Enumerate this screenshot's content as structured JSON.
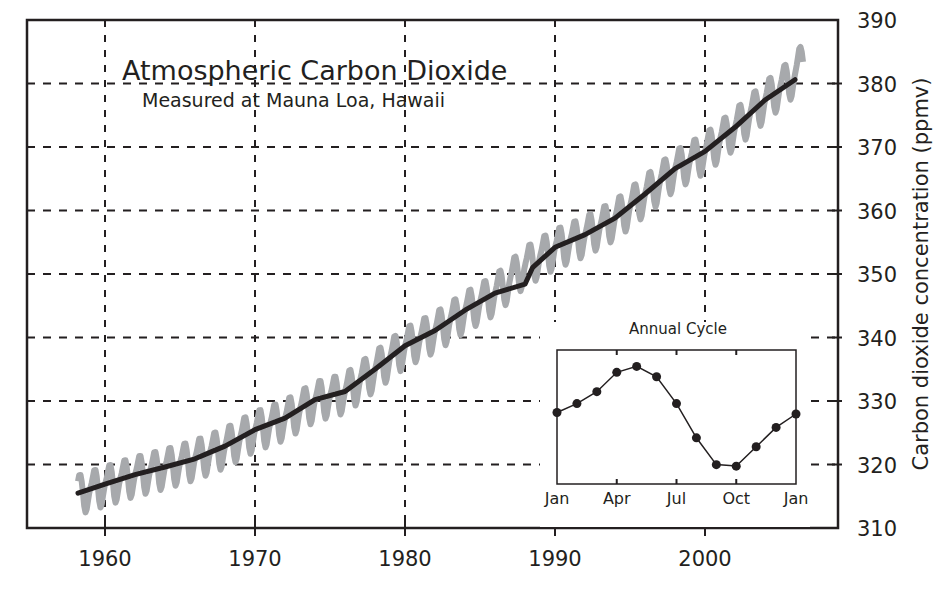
{
  "chart_data": {
    "type": "line",
    "title": "Atmospheric Carbon Dioxide",
    "subtitle": "Measured at Mauna Loa, Hawaii",
    "xlabel": "",
    "ylabel": "Carbon dioxide concentration (ppmv)",
    "xlim": [
      1955,
      2009
    ],
    "ylim": [
      310,
      390
    ],
    "x_ticks": [
      1960,
      1970,
      1980,
      1990,
      2000
    ],
    "y_ticks": [
      310,
      320,
      330,
      340,
      350,
      360,
      370,
      380,
      390
    ],
    "grid": true,
    "grid_style": "dashed",
    "y_axis_position": "right",
    "series": [
      {
        "name": "Monthly mean (seasonal)",
        "color": "#a7a9ac",
        "style": "zigzag",
        "seasonal_amplitude_ppm": 3.2,
        "x": [
          1958.2,
          1960,
          1962,
          1964,
          1966,
          1968,
          1970,
          1972,
          1974,
          1976,
          1978,
          1980,
          1982,
          1984,
          1986,
          1988,
          1990,
          1992,
          1994,
          1996,
          1998,
          2000,
          2002,
          2004,
          2006,
          2006.6
        ],
        "values": [
          315.5,
          316.9,
          318.4,
          319.6,
          321.0,
          322.9,
          325.5,
          327.3,
          330.2,
          331.5,
          335.0,
          338.7,
          341.1,
          344.3,
          347.0,
          351.4,
          354.2,
          356.2,
          358.8,
          362.6,
          366.6,
          369.3,
          373.1,
          377.4,
          381.5,
          384.0
        ]
      },
      {
        "name": "Annual mean (trend)",
        "color": "#231f20",
        "style": "solid",
        "x": [
          1958.2,
          1960,
          1962,
          1964,
          1966,
          1967,
          1968,
          1970,
          1972,
          1974,
          1976,
          1978,
          1980,
          1982,
          1984,
          1986,
          1988,
          1988.5,
          1990,
          1992,
          1994,
          1996,
          1998,
          2000,
          2002,
          2004,
          2006
        ],
        "values": [
          315.5,
          316.9,
          318.4,
          319.6,
          320.9,
          321.9,
          322.9,
          325.5,
          327.3,
          330.2,
          331.5,
          335.0,
          338.7,
          341.1,
          344.3,
          347.0,
          348.4,
          351.0,
          354.2,
          356.2,
          358.8,
          362.6,
          366.6,
          369.3,
          373.1,
          377.4,
          380.6
        ]
      }
    ],
    "inset": {
      "type": "line",
      "title": "Annual Cycle",
      "categories": [
        "Jan",
        "Feb",
        "Mar",
        "Apr",
        "May",
        "Jun",
        "Jul",
        "Aug",
        "Sep",
        "Oct",
        "Nov",
        "Dec",
        "Jan"
      ],
      "x_tick_labels": [
        "Jan",
        "Apr",
        "Jul",
        "Oct",
        "Jan"
      ],
      "values": [
        0.0,
        0.6,
        1.4,
        2.7,
        3.1,
        2.4,
        0.6,
        -1.7,
        -3.5,
        -3.6,
        -2.3,
        -1.0,
        -0.1
      ],
      "ylim": [
        -4.8,
        4.2
      ],
      "units": "relative ppmv (approx.)",
      "marker": "circle"
    }
  }
}
